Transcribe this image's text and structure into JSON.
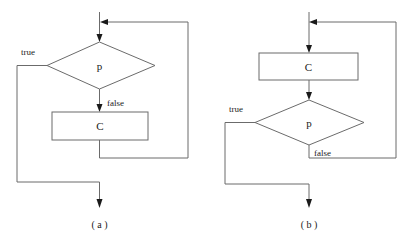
{
  "figure": {
    "title": "",
    "background_color": "#ffffff",
    "line_color": "#6b6b6b",
    "text_color": "#1a1a1a"
  },
  "diagrams": [
    {
      "id": "a",
      "caption": "( a )",
      "description": "while loop flowchart: condition tested before body",
      "nodes": [
        {
          "name": "decision",
          "shape": "diamond",
          "label": "p"
        },
        {
          "name": "process",
          "shape": "rectangle",
          "label": "C"
        }
      ],
      "edge_labels": [
        {
          "name": "true-branch",
          "label": "true"
        },
        {
          "name": "false-branch",
          "label": "false"
        }
      ]
    },
    {
      "id": "b",
      "caption": "( b )",
      "description": "do-while loop flowchart: body executed before condition",
      "nodes": [
        {
          "name": "process",
          "shape": "rectangle",
          "label": "C"
        },
        {
          "name": "decision",
          "shape": "diamond",
          "label": "p"
        }
      ],
      "edge_labels": [
        {
          "name": "true-branch",
          "label": "true"
        },
        {
          "name": "false-branch",
          "label": "false"
        }
      ]
    }
  ]
}
